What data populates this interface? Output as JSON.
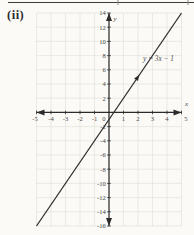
{
  "page": {
    "item_label": "(ii)"
  },
  "chart_data": {
    "type": "line",
    "title": "",
    "xlabel": "x",
    "ylabel": "y",
    "xlim": [
      -5,
      5
    ],
    "ylim": [
      -16,
      14
    ],
    "grid": true,
    "x_ticks": [
      -5,
      -4,
      -3,
      -2,
      -1,
      0,
      1,
      2,
      3,
      4,
      5
    ],
    "y_ticks": [
      -16,
      -14,
      -12,
      -10,
      -8,
      -6,
      -4,
      -2,
      2,
      4,
      6,
      8,
      10,
      12,
      14
    ],
    "series": [
      {
        "name": "y = 3x − 1",
        "slope": 3,
        "intercept": -1,
        "points": [
          [
            -5,
            -16
          ],
          [
            0,
            -1
          ],
          [
            5,
            14
          ]
        ],
        "y_intercept": -1,
        "x_intercept": 0.33,
        "direction_marker_at": [
          2,
          5
        ]
      }
    ],
    "annotation": {
      "text": "y = 3x − 1",
      "at": [
        2.35,
        7.2
      ]
    },
    "colors": {
      "axis": "#2b2b2b",
      "line": "#2e2e2e",
      "grid": "#e1e0d9",
      "text": "#4a4a4a",
      "paper": "#fbfaf7",
      "rule": "#3c3c3c"
    }
  }
}
